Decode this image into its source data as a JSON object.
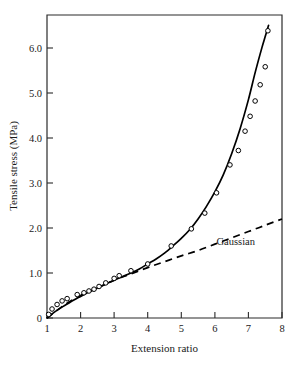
{
  "chart_data": {
    "type": "line",
    "title": "",
    "xlabel": "Extension ratio",
    "ylabel": "Tensile stress (MPa)",
    "xlim": [
      1,
      8
    ],
    "ylim": [
      0,
      6.73
    ],
    "grid": false,
    "legend_position": "none",
    "xticks": [
      1,
      2,
      3,
      4,
      5,
      6,
      7,
      8
    ],
    "xtick_labels": [
      "1",
      "2",
      "3",
      "4",
      "5",
      "6",
      "7",
      "8"
    ],
    "yticks": [
      0,
      1.0,
      2.0,
      3.0,
      4.0,
      5.0,
      6.0
    ],
    "ytick_labels": [
      "0",
      "1.0",
      "2.0",
      "3.0",
      "4.0",
      "5.0",
      "6.0"
    ],
    "annotations": [
      {
        "text": "Gaussian",
        "x": 6.05,
        "y": 1.62
      }
    ],
    "series": [
      {
        "name": "experimental-curve",
        "style": "solid",
        "marker": "none",
        "x": [
          1.0,
          1.2,
          1.4,
          1.6,
          1.8,
          2.0,
          2.2,
          2.4,
          2.6,
          2.8,
          3.0,
          3.25,
          3.5,
          3.75,
          4.0,
          4.25,
          4.5,
          4.75,
          5.0,
          5.25,
          5.5,
          5.75,
          6.0,
          6.25,
          6.5,
          6.75,
          7.0,
          7.2,
          7.4,
          7.5,
          7.6
        ],
        "y": [
          0.0,
          0.12,
          0.22,
          0.31,
          0.4,
          0.48,
          0.56,
          0.63,
          0.7,
          0.77,
          0.84,
          0.92,
          1.0,
          1.09,
          1.2,
          1.31,
          1.44,
          1.6,
          1.77,
          1.96,
          2.2,
          2.48,
          2.8,
          3.18,
          3.65,
          4.2,
          4.85,
          5.45,
          6.0,
          6.25,
          6.5
        ]
      },
      {
        "name": "gaussian-theory",
        "style": "dashed",
        "marker": "none",
        "x": [
          1.0,
          1.5,
          2.0,
          2.5,
          3.0,
          3.5,
          4.0,
          4.5,
          5.0,
          5.5,
          6.0,
          6.5,
          7.0,
          7.5,
          8.0
        ],
        "y": [
          0.0,
          0.28,
          0.5,
          0.67,
          0.84,
          0.98,
          1.12,
          1.25,
          1.38,
          1.5,
          1.64,
          1.78,
          1.92,
          2.06,
          2.2
        ]
      }
    ],
    "data_points": {
      "name": "measured-data",
      "marker": "open-circle",
      "x": [
        1.05,
        1.15,
        1.3,
        1.45,
        1.6,
        1.9,
        2.1,
        2.25,
        2.4,
        2.55,
        2.75,
        3.0,
        3.15,
        3.5,
        4.0,
        4.7,
        5.3,
        5.7,
        6.05,
        6.45,
        6.7,
        6.9,
        7.05,
        7.2,
        7.35,
        7.5,
        7.58
      ],
      "y": [
        0.08,
        0.2,
        0.3,
        0.38,
        0.43,
        0.52,
        0.56,
        0.6,
        0.64,
        0.7,
        0.78,
        0.88,
        0.94,
        1.05,
        1.2,
        1.6,
        1.98,
        2.33,
        2.78,
        3.4,
        3.72,
        4.15,
        4.48,
        4.82,
        5.18,
        5.58,
        6.38
      ]
    }
  },
  "figure": {
    "caption": ""
  }
}
